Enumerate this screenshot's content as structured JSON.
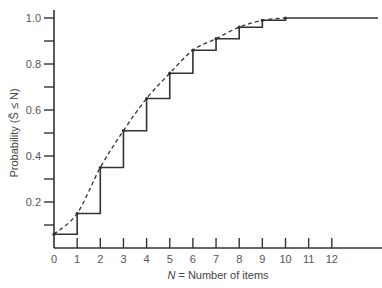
{
  "chart_data": {
    "type": "line",
    "title": "",
    "xlabel": "N = Number of items",
    "xlabel_italic": "N",
    "xlabel_rest": " = Number of items",
    "ylabel": "Probability (S̃ ≤ N)",
    "xlim": [
      0,
      14
    ],
    "ylim": [
      0,
      1.05
    ],
    "x_ticks": [
      0,
      1,
      2,
      3,
      4,
      5,
      6,
      7,
      8,
      9,
      10,
      11,
      12
    ],
    "x_tick_labels": [
      "0",
      "1",
      "2",
      "3",
      "4",
      "5",
      "6",
      "7",
      "8",
      "9",
      "10",
      "11",
      "12"
    ],
    "y_major_ticks": [
      0.2,
      0.4,
      0.6,
      0.8,
      1.0
    ],
    "y_tick_labels": [
      "0.2",
      "0.4",
      "0.6",
      "0.8",
      "1.0"
    ],
    "y_minor_ticks": [
      0.1,
      0.3,
      0.5,
      0.7,
      0.9
    ],
    "grid": false,
    "legend": null,
    "series": [
      {
        "name": "Discrete cumulative distribution (step)",
        "style": "solid-step",
        "x": [
          0,
          1,
          2,
          3,
          4,
          5,
          6,
          7,
          8,
          9,
          10
        ],
        "values": [
          0.06,
          0.15,
          0.35,
          0.51,
          0.65,
          0.76,
          0.86,
          0.91,
          0.96,
          0.99,
          1.0
        ],
        "extends_to_x": 14
      },
      {
        "name": "Continuous approximation",
        "style": "dashed",
        "x": [
          0,
          1,
          2,
          3,
          4,
          5,
          6,
          7,
          8,
          9,
          10
        ],
        "values": [
          0.06,
          0.15,
          0.35,
          0.51,
          0.65,
          0.76,
          0.86,
          0.91,
          0.96,
          0.99,
          1.0
        ]
      }
    ]
  }
}
